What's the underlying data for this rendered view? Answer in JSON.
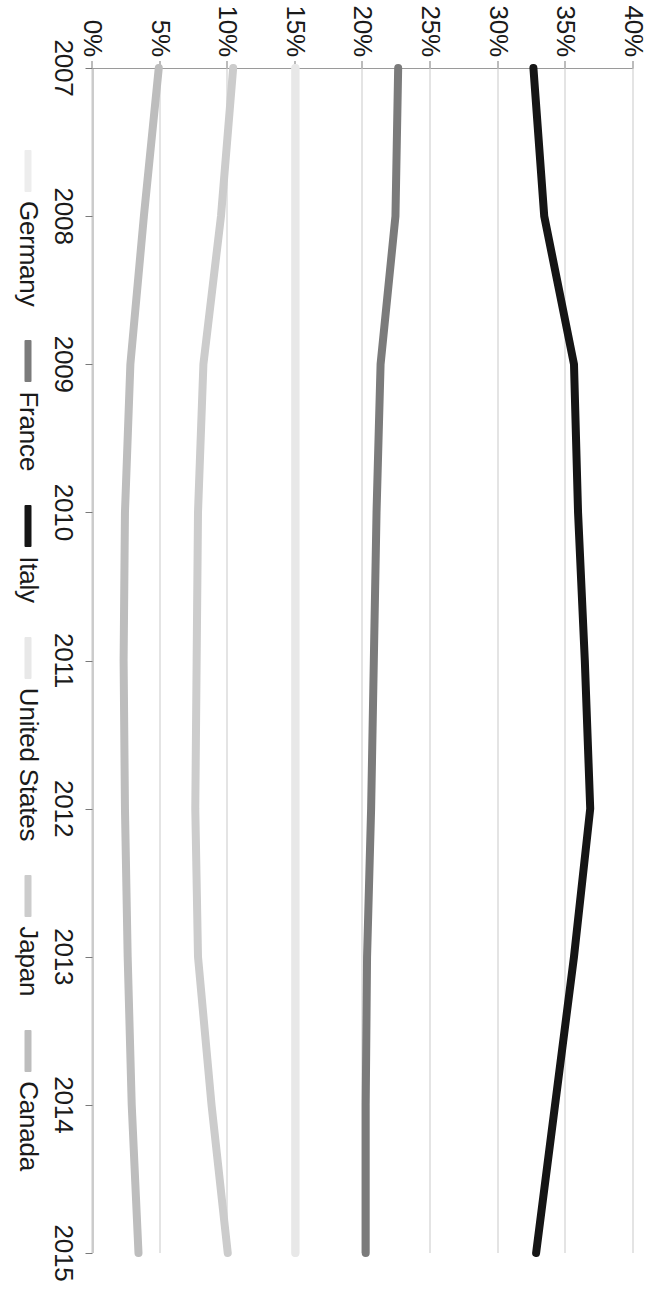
{
  "chart_data": {
    "type": "line",
    "title": "",
    "subtitle": "",
    "xlabel": "",
    "ylabel": "",
    "orientation": "rotated-90-clockwise",
    "x": [
      2007,
      2008,
      2009,
      2010,
      2011,
      2012,
      2013,
      2014,
      2015
    ],
    "categories": [
      "2007",
      "2008",
      "2009",
      "2010",
      "2011",
      "2012",
      "2013",
      "2014",
      "2015"
    ],
    "ylim": [
      0,
      40
    ],
    "yticks": [
      0,
      5,
      10,
      15,
      20,
      25,
      30,
      35,
      40
    ],
    "ytick_labels": [
      "0%",
      "5%",
      "10%",
      "15%",
      "20%",
      "25%",
      "30%",
      "35%",
      "40%"
    ],
    "xtick_labels": [
      "2007",
      "2008",
      "2009",
      "2010",
      "2011",
      "2012",
      "2013",
      "2014",
      "2015"
    ],
    "grid": true,
    "grid_axis": "y",
    "legend_position": "bottom",
    "value_suffix": "%",
    "series": [
      {
        "name": "Germany",
        "color": "#ededed",
        "values": [
          15.0,
          15.0,
          15.0,
          15.0,
          15.0,
          15.0,
          15.0,
          15.0,
          15.0
        ]
      },
      {
        "name": "France",
        "color": "#7b7b7b",
        "values": [
          22.6,
          22.4,
          21.3,
          21.0,
          20.8,
          20.6,
          20.3,
          20.2,
          20.2
        ]
      },
      {
        "name": "Italy",
        "color": "#151515",
        "values": [
          32.6,
          33.4,
          35.6,
          35.9,
          36.4,
          36.8,
          35.6,
          34.2,
          32.8
        ]
      },
      {
        "name": "United States",
        "color": "#e8e8e8",
        "values": [
          15.0,
          15.0,
          15.0,
          15.0,
          15.0,
          15.0,
          15.0,
          15.0,
          15.0
        ]
      },
      {
        "name": "Japan",
        "color": "#cccccc",
        "values": [
          10.4,
          9.5,
          8.2,
          7.8,
          7.7,
          7.6,
          7.8,
          8.8,
          10.0
        ]
      },
      {
        "name": "Canada",
        "color": "#bdbdbd",
        "values": [
          4.9,
          3.8,
          2.8,
          2.4,
          2.3,
          2.4,
          2.6,
          2.9,
          3.4
        ]
      }
    ]
  },
  "legend": {
    "items": [
      {
        "label": "Germany",
        "color": "#ededed"
      },
      {
        "label": "France",
        "color": "#7b7b7b"
      },
      {
        "label": "Italy",
        "color": "#151515"
      },
      {
        "label": "United States",
        "color": "#e8e8e8"
      },
      {
        "label": "Japan",
        "color": "#cccccc"
      },
      {
        "label": "Canada",
        "color": "#bdbdbd"
      }
    ]
  },
  "colors": {
    "grid": "#c9c9c9",
    "axis": "#9a9a9a",
    "text": "#1a1a1a",
    "background": "#ffffff"
  }
}
